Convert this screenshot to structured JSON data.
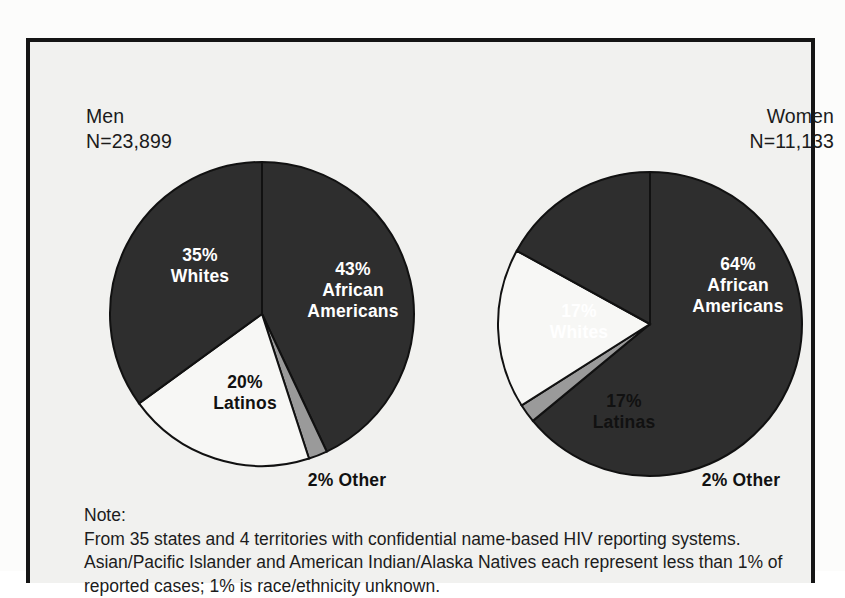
{
  "figure": {
    "background_color": "#f1f1ef",
    "border_color": "#151515"
  },
  "colors": {
    "dark_slice": "#2e2e2e",
    "light_slice": "#f7f7f5",
    "gray_slice": "#9a9a9a",
    "outline": "#111111",
    "label_on_dark": "#ffffff",
    "label_on_light": "#111111"
  },
  "panels": {
    "men": {
      "group_label": "Men",
      "n_label": "N=23,899",
      "labels": {
        "african_americans": "43%\nAfrican\nAmericans",
        "african_americans_pct": "43%",
        "african_americans_name_1": "African",
        "african_americans_name_2": "Americans",
        "whites_pct": "35%",
        "whites_name": "Whites",
        "latinos_pct": "20%",
        "latinos_name": "Latinos",
        "other": "2% Other"
      }
    },
    "women": {
      "group_label": "Women",
      "n_label": "N=11,133",
      "labels": {
        "african_americans_pct": "64%",
        "african_americans_name_1": "African",
        "african_americans_name_2": "Americans",
        "whites_pct": "17%",
        "whites_name": "Whites",
        "latinas_pct": "17%",
        "latinas_name": "Latinas",
        "other": "2% Other"
      }
    }
  },
  "note": {
    "title": "Note:",
    "body": "From 35 states and 4 territories with confidential name-based HIV reporting systems. Asian/Pacific Islander and American Indian/Alaska Natives each represent less than 1% of reported cases; 1% is race/ethnicity unknown."
  },
  "chart_data": [
    {
      "type": "pie",
      "title": "Men",
      "subtitle": "N=23,899",
      "total_n": 23899,
      "categories": [
        "African Americans",
        "Other",
        "Latinos",
        "Whites"
      ],
      "values": [
        43,
        20,
        2,
        35
      ],
      "unit": "percent",
      "slices": [
        {
          "label": "African Americans",
          "value": 43,
          "color": "#2e2e2e",
          "start_deg": 0,
          "end_deg": 154.8,
          "text_color": "#ffffff"
        },
        {
          "label": "Other",
          "value": 2,
          "color": "#9a9a9a",
          "start_deg": 154.8,
          "end_deg": 162.0,
          "text_color": "#111111"
        },
        {
          "label": "Latinos",
          "value": 20,
          "color": "#f7f7f5",
          "start_deg": 162.0,
          "end_deg": 234.0,
          "text_color": "#111111"
        },
        {
          "label": "Whites",
          "value": 35,
          "color": "#2e2e2e",
          "start_deg": 234.0,
          "end_deg": 360.0,
          "text_color": "#ffffff"
        }
      ],
      "legend": "none",
      "data_labels": true
    },
    {
      "type": "pie",
      "title": "Women",
      "subtitle": "N=11,133",
      "total_n": 11133,
      "categories": [
        "African Americans",
        "Other",
        "Latinas",
        "Whites"
      ],
      "values": [
        64,
        17,
        2,
        17
      ],
      "unit": "percent",
      "slices": [
        {
          "label": "African Americans",
          "value": 64,
          "color": "#2e2e2e",
          "start_deg": 0,
          "end_deg": 230.4,
          "text_color": "#ffffff"
        },
        {
          "label": "Other",
          "value": 2,
          "color": "#9a9a9a",
          "start_deg": 230.4,
          "end_deg": 237.6,
          "text_color": "#111111"
        },
        {
          "label": "Latinas",
          "value": 17,
          "color": "#f7f7f5",
          "start_deg": 237.6,
          "end_deg": 298.8,
          "text_color": "#111111"
        },
        {
          "label": "Whites",
          "value": 17,
          "color": "#2e2e2e",
          "start_deg": 298.8,
          "end_deg": 360.0,
          "text_color": "#ffffff"
        }
      ],
      "legend": "none",
      "data_labels": true
    }
  ]
}
